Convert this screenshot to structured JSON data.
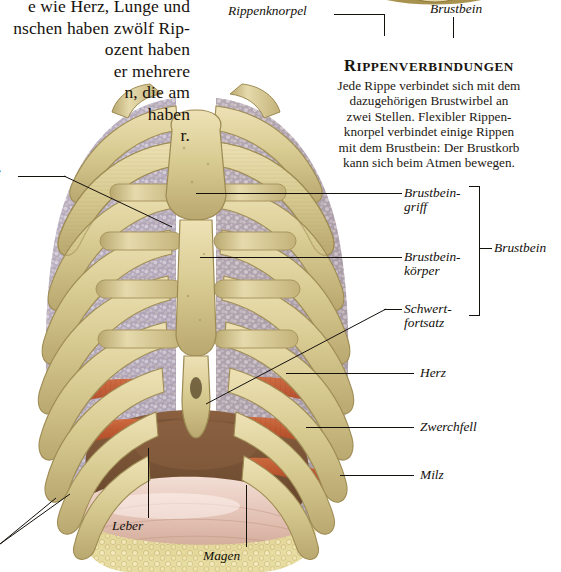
{
  "page": {
    "language": "de",
    "kind": "anatomy-textbook-page"
  },
  "body_text": {
    "lines": [
      "e wie Herz, Lunge und",
      "nschen haben zwölf Rip-",
      "ozent haben",
      "er mehrere",
      "n, die am",
      " haben",
      "r."
    ]
  },
  "sidebar": {
    "heading": "RIPPENVERBINDUNGEN",
    "heading_initial": "R",
    "heading_rest": "IPPENVERBINDUNGEN",
    "paragraph_lines": [
      "Jede Rippe verbindet sich mit dem",
      "dazugehörigen Brustwirbel an",
      "zwei Stellen. Flexibler Rippen-",
      "knorpel verbindet einige Rippen",
      "mit dem Brustbein: Der Brustkorb",
      "kann sich beim Atmen bewegen."
    ]
  },
  "inset_diagram": {
    "name": "rib-ring-cross-section",
    "labels": {
      "cartilage": "Rippenknorpel",
      "sternum": "Brustbein"
    }
  },
  "labels": {
    "lung": "ge",
    "lung_full": "Lunge",
    "manubrium_l1": "Brustbein-",
    "manubrium_l2": "griff",
    "body_l1": "Brustbein-",
    "body_l2": "körper",
    "xiphoid_l1": "Schwert-",
    "xiphoid_l2": "fortsatz",
    "sternum_group": "Brustbein",
    "heart": "Herz",
    "diaphragm": "Zwerchfell",
    "spleen": "Milz",
    "liver": "Leber",
    "stomach": "Magen"
  },
  "colors": {
    "bone": "#d9cc93",
    "bone_light": "#e8dcae",
    "bone_shade": "#bfae74",
    "lung": "#b9afbe",
    "lung_light": "#ded8e2",
    "lung_dark": "#8d8294",
    "muscle": "#c0552f",
    "liver": "#7a5336",
    "stomach": "#e6c6bb",
    "fat": "#ddd08b",
    "ink": "#14100b",
    "paper": "#ffffff"
  }
}
